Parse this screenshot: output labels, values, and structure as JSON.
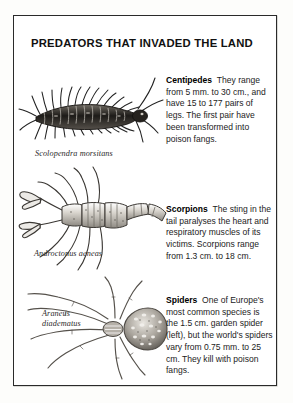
{
  "page": {
    "title": "PREDATORS THAT INVADED THE LAND",
    "frame_color": "#2a2a2a",
    "background_color": "#ffffff"
  },
  "entries": [
    {
      "id": "centipede",
      "illustration": "centipede-illustration",
      "caption": "Scolopendra morsitans",
      "lead": "Centipedes",
      "text": "They range from 5 mm. to 30 cm., and have 15 to 177 pairs of legs. The first pair have been transformed into poison fangs."
    },
    {
      "id": "scorpion",
      "illustration": "scorpion-illustration",
      "caption": "Androctonus aeneas",
      "lead": "Scorpions",
      "text": "The sting in the tail paralyses the heart and respiratory muscles of its victims. Scorpions range from 1.3 cm. to 18 cm."
    },
    {
      "id": "spider",
      "illustration": "spider-illustration",
      "caption_line1": "Araneus",
      "caption_line2": "diadematus",
      "lead": "Spiders",
      "text": "One of Europe's most common species is the 1.5 cm. garden spider (left), but the world's spiders vary from 0.75 mm. to 25 cm. They kill with poison fangs."
    }
  ]
}
